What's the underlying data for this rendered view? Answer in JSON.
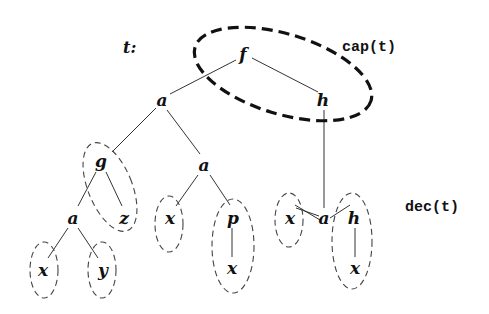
{
  "diagram": {
    "tree_label": "t:",
    "cap_label": "cap(t)",
    "dec_label": "dec(t)",
    "nodes": [
      {
        "id": "f",
        "label": "f"
      },
      {
        "id": "a1",
        "label": "a"
      },
      {
        "id": "h1",
        "label": "h"
      },
      {
        "id": "g",
        "label": "g"
      },
      {
        "id": "a2",
        "label": "a"
      },
      {
        "id": "a3",
        "label": "a"
      },
      {
        "id": "a4",
        "label": "a"
      },
      {
        "id": "z",
        "label": "z"
      },
      {
        "id": "x1",
        "label": "x"
      },
      {
        "id": "y",
        "label": "y"
      },
      {
        "id": "x2",
        "label": "x"
      },
      {
        "id": "p",
        "label": "p"
      },
      {
        "id": "x3",
        "label": "x"
      },
      {
        "id": "x4",
        "label": "x"
      },
      {
        "id": "h2",
        "label": "h"
      },
      {
        "id": "x5",
        "label": "x"
      }
    ],
    "edges": [
      [
        "f",
        "a1"
      ],
      [
        "f",
        "h1"
      ],
      [
        "a1",
        "g"
      ],
      [
        "a1",
        "a2"
      ],
      [
        "h1",
        "a3"
      ],
      [
        "g",
        "a4"
      ],
      [
        "g",
        "z"
      ],
      [
        "a4",
        "x1"
      ],
      [
        "a4",
        "y"
      ],
      [
        "a2",
        "x2"
      ],
      [
        "a2",
        "p"
      ],
      [
        "p",
        "x3"
      ],
      [
        "a3",
        "x4"
      ],
      [
        "a3",
        "h2"
      ],
      [
        "h2",
        "x5"
      ]
    ],
    "cap_group": [
      "f",
      "h1"
    ],
    "dec_groups": [
      [
        "g",
        "z"
      ],
      [
        "x1"
      ],
      [
        "y"
      ],
      [
        "x2"
      ],
      [
        "p",
        "x3"
      ],
      [
        "x4"
      ],
      [
        "h2",
        "x5"
      ]
    ]
  }
}
